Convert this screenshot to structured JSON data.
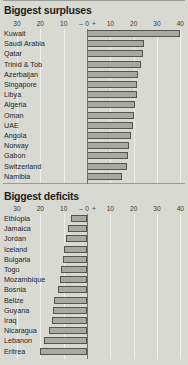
{
  "background_color": "#d9d9d4",
  "bar_fill_color": "#a9a9a4",
  "bar_border_color": "#55554f",
  "axis": {
    "ticks": [
      "30",
      "20",
      "10",
      "0",
      "10",
      "20",
      "30",
      "40"
    ],
    "tick_values": [
      -30,
      -20,
      -10,
      0,
      10,
      20,
      30,
      40
    ],
    "negative_sign": "–",
    "positive_sign": "+",
    "min": -36,
    "max": 42
  },
  "panels": [
    {
      "id": "surpluses",
      "title": "Biggest surpluses"
    },
    {
      "id": "deficits",
      "title": "Biggest deficits"
    }
  ],
  "chart_data": [
    {
      "type": "bar",
      "title": "Biggest surpluses",
      "orientation": "horizontal",
      "xlabel": "",
      "ylabel": "",
      "xlim": [
        -36,
        42
      ],
      "grid": true,
      "legend": "none",
      "xticks": [
        -30,
        -20,
        -10,
        0,
        10,
        20,
        30,
        40
      ],
      "xticklabels": [
        "30",
        "20",
        "10",
        "0",
        "10",
        "20",
        "30",
        "40"
      ],
      "categories": [
        "Kuwait",
        "Saudi Arabia",
        "Qatar",
        "Trinid & Tob",
        "Azerbaijan",
        "Singapore",
        "Libya",
        "Algeria",
        "Oman",
        "UAE",
        "Angola",
        "Norway",
        "Gabon",
        "Switzerland",
        "Namibia"
      ],
      "values": [
        40.0,
        24.5,
        24.0,
        23.0,
        22.0,
        21.5,
        21.5,
        20.5,
        20.0,
        19.5,
        19.0,
        18.0,
        17.5,
        17.0,
        15.0
      ]
    },
    {
      "type": "bar",
      "title": "Biggest deficits",
      "orientation": "horizontal",
      "xlabel": "",
      "ylabel": "",
      "xlim": [
        -36,
        42
      ],
      "grid": true,
      "legend": "none",
      "xticks": [
        -30,
        -20,
        -10,
        0,
        10,
        20,
        30,
        40
      ],
      "xticklabels": [
        "30",
        "20",
        "10",
        "0",
        "10",
        "20",
        "30",
        "40"
      ],
      "categories": [
        "Ethiopia",
        "Jamaica",
        "Jordan",
        "Iceland",
        "Bulgaria",
        "Togo",
        "Mozambique",
        "Bosnia",
        "Belize",
        "Guyana",
        "Iraq",
        "Nicaragua",
        "Lebanon",
        "Eritrea"
      ],
      "values": [
        -7.0,
        -8.0,
        -9.0,
        -10.0,
        -10.5,
        -11.0,
        -11.5,
        -12.5,
        -14.0,
        -14.5,
        -15.0,
        -16.5,
        -18.5,
        -20.0
      ]
    }
  ]
}
